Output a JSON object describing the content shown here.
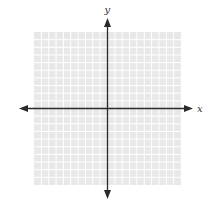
{
  "chart_data": {
    "type": "scatter",
    "title": "",
    "xlabel": "x",
    "ylabel": "y",
    "grid": true,
    "grid_cells": {
      "x": 20,
      "y": 20
    },
    "xlim": [
      -10,
      10
    ],
    "ylim": [
      -10,
      10
    ],
    "series": [],
    "tick_labels": {
      "x": [],
      "y": []
    },
    "legend": null
  },
  "style": {
    "grid_background": "#e8e8e8",
    "grid_line": "#ffffff",
    "axis_color": "#2a2a2a"
  },
  "labels": {
    "x_axis": "x",
    "y_axis": "y"
  }
}
